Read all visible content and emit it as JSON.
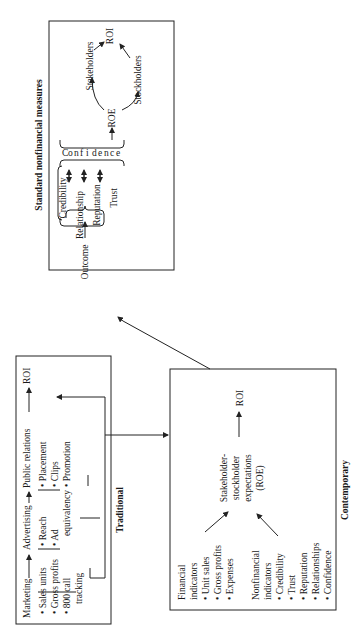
{
  "standard_box": {
    "title": "Standard nonfinancial measures",
    "outcome": "Outcome",
    "items": [
      "Credibility",
      "Relationship",
      "Reputation",
      "Trust"
    ],
    "confidence_letters": [
      "C",
      "o",
      "n",
      "f",
      "i",
      "d",
      "e",
      "n",
      "c",
      "e"
    ],
    "roe": "ROE",
    "stakeholders": "Stakeholders",
    "stockholders": "Stockholders",
    "roi": "ROI"
  },
  "traditional_box": {
    "title": "Traditional",
    "chain": [
      "Marketing",
      "Advertising",
      "Public relations",
      "ROI"
    ],
    "marketing_bullets": [
      "Sales units",
      "Gross profits",
      "800 call",
      "tracking"
    ],
    "advertising_bullets": [
      "Reach",
      "Ad",
      "equivalency"
    ],
    "pr_bullets": [
      "Placement",
      "Clips",
      "Promotion"
    ]
  },
  "contemporary_box": {
    "title": "Contemporary",
    "financial_heading": [
      "Financial",
      "indicators"
    ],
    "financial_bullets": [
      "Unit sales",
      "Gross profits",
      "Expenses"
    ],
    "nonfinancial_heading": [
      "Nonfinancial",
      "indicators"
    ],
    "nonfinancial_bullets": [
      "Credibility",
      "Trust",
      "Reputation",
      "Relationships",
      "Confidence"
    ],
    "center": [
      "Stakeholder-",
      "stockholder",
      "expectations",
      "(ROE)"
    ],
    "roi": "ROI"
  },
  "colors": {
    "ink": "#1a1a1a",
    "background": "#ffffff"
  }
}
